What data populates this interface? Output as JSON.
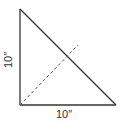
{
  "diagram": {
    "type": "right-triangle",
    "colors": {
      "stroke": "#333333",
      "dashed": "#555555",
      "text": "#333333",
      "background": "#ffffff"
    },
    "vertices": {
      "top": [
        20,
        9
      ],
      "bottom_left": [
        20,
        105
      ],
      "bottom_right": [
        116,
        105
      ]
    },
    "dashed_line": {
      "from": [
        20,
        105
      ],
      "to": [
        78,
        45
      ],
      "description": "diagonal from right-angle corner toward hypotenuse"
    },
    "labels": {
      "vertical_side": "10″",
      "horizontal_side": "10″"
    }
  }
}
